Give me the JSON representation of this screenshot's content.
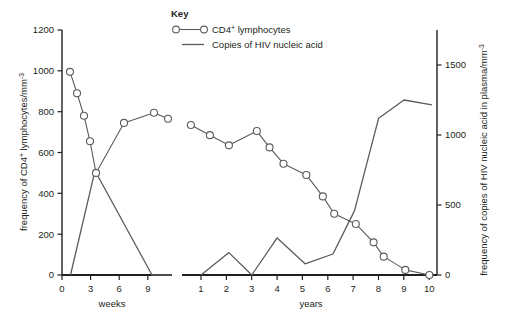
{
  "chart_data": {
    "type": "line",
    "title": "",
    "subtitle": "",
    "panels": [
      {
        "name": "weeks",
        "xlabel": "weeks",
        "x_ticks": [
          0,
          3,
          6,
          9
        ],
        "xlim": [
          0,
          11
        ],
        "series": [
          {
            "name": "CD4+ lymphocytes",
            "axis": "left",
            "marker": "open-circle",
            "x": [
              0.8,
              1.5,
              2.2,
              2.8,
              3.4,
              6.2,
              9.2,
              10.6
            ],
            "values": [
              995,
              890,
              780,
              655,
              500,
              745,
              795,
              765
            ]
          },
          {
            "name": "Copies of HIV nucleic acid",
            "axis": "right",
            "marker": "none",
            "x": [
              0.85,
              3.3,
              9.0,
              11.0
            ],
            "values": [
              0,
              745,
              0,
              0
            ]
          }
        ]
      },
      {
        "name": "years",
        "xlabel": "years",
        "x_ticks": [
          1,
          2,
          3,
          4,
          5,
          6,
          7,
          8,
          9,
          10
        ],
        "xlim": [
          0.25,
          10.3
        ],
        "series": [
          {
            "name": "CD4+ lymphocytes",
            "axis": "left",
            "marker": "open-circle",
            "x": [
              0.6,
              1.35,
              2.1,
              3.2,
              3.7,
              4.25,
              5.15,
              5.8,
              6.25,
              7.1,
              7.8,
              8.2,
              9.05,
              10.0
            ],
            "values": [
              735,
              685,
              635,
              705,
              625,
              545,
              490,
              385,
              300,
              250,
              160,
              90,
              25,
              0
            ]
          },
          {
            "name": "Copies of HIV nucleic acid",
            "axis": "right",
            "marker": "none",
            "x": [
              1.0,
              2.1,
              3.0,
              4.0,
              5.1,
              6.2,
              7.05,
              8.0,
              9.0,
              10.1
            ],
            "values": [
              0,
              160,
              0,
              265,
              80,
              150,
              460,
              1120,
              1250,
              1215
            ]
          }
        ]
      }
    ],
    "y_left": {
      "label_main": "frequency of CD4",
      "label_sup1": "+",
      "label_mid": " lymphocytes/mm",
      "label_sup2": "-3",
      "ticks": [
        0,
        200,
        400,
        600,
        800,
        1000,
        1200
      ],
      "ylim": [
        0,
        1200
      ]
    },
    "y_right": {
      "label_main": "frequency of copies of HIV nucleic acid in plasma/mm",
      "label_sup": "-3",
      "ticks": [
        0,
        500,
        1000,
        1500
      ],
      "ylim": [
        0,
        1750
      ]
    },
    "legend": {
      "title": "Key",
      "position": "top-center",
      "entries": [
        {
          "label_main": "CD4",
          "label_sup": "+",
          "label_rest": " lymphocytes",
          "marker": "open-circle-line"
        },
        {
          "label_main": "Copies of HIV nucleic acid",
          "label_sup": "",
          "label_rest": "",
          "marker": "line"
        }
      ]
    },
    "grid": false,
    "colors": {
      "line": "#5b5b5f",
      "axis": "#231f20",
      "marker_fill": "#ffffff",
      "text": "#231f20"
    }
  }
}
